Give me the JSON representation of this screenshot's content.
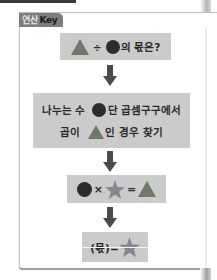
{
  "header": {
    "tab_prefix": "연산",
    "tab_label": "Key"
  },
  "colors": {
    "tab_bg": "#7d7d7d",
    "box_bg": "#cbcbcb",
    "triangle": "#6d7a6a",
    "circle": "#2c2c2c",
    "star": "#8a8590",
    "arrow": "#4a4a4a"
  },
  "steps": [
    {
      "symbols": [
        "triangle-icon",
        "circle-icon"
      ],
      "operator": "÷",
      "suffix": "의 몫은?"
    },
    {
      "line1": {
        "before": "나누는 수",
        "symbol": "circle-icon",
        "after": "단 곱셈구구에서"
      },
      "line2": {
        "before": "곱이",
        "symbol": "triangle-icon",
        "after": "인 경우 찾기"
      }
    },
    {
      "symbols": [
        "circle-icon",
        "star-icon",
        "triangle-icon"
      ],
      "times": "×",
      "equals": "="
    },
    {
      "prefix": "(몫)=",
      "symbol": "star-icon"
    }
  ],
  "arrows": [
    "down-arrow-icon",
    "down-arrow-icon",
    "down-arrow-icon"
  ]
}
